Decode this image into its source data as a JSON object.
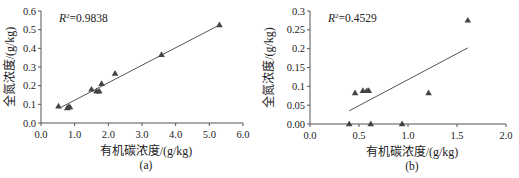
{
  "chart_data": [
    {
      "id": "a",
      "type": "scatter",
      "caption": "(a)",
      "xlabel": "有机碳浓度/(g/kg)",
      "ylabel": "全氮浓度/(g/kg)",
      "annotation": {
        "label": "R",
        "sup": "2",
        "value": "=0.9838"
      },
      "xlim": [
        0.0,
        6.0
      ],
      "ylim": [
        0.0,
        0.6
      ],
      "xticks": [
        "0.0",
        "1.0",
        "2.0",
        "3.0",
        "4.0",
        "5.0",
        "6.0"
      ],
      "yticks": [
        "0.0",
        "0.1",
        "0.2",
        "0.3",
        "0.4",
        "0.5",
        "0.6"
      ],
      "grid": false,
      "marker": "triangle",
      "points": [
        {
          "x": 0.52,
          "y": 0.09
        },
        {
          "x": 0.78,
          "y": 0.08
        },
        {
          "x": 0.82,
          "y": 0.085
        },
        {
          "x": 0.86,
          "y": 0.085
        },
        {
          "x": 1.5,
          "y": 0.18
        },
        {
          "x": 1.65,
          "y": 0.17
        },
        {
          "x": 1.73,
          "y": 0.17
        },
        {
          "x": 1.8,
          "y": 0.21
        },
        {
          "x": 2.2,
          "y": 0.265
        },
        {
          "x": 3.58,
          "y": 0.365
        },
        {
          "x": 5.3,
          "y": 0.525
        }
      ],
      "trendline": {
        "x1": 0.55,
        "y1": 0.08,
        "x2": 5.3,
        "y2": 0.525
      },
      "r_squared": 0.9838
    },
    {
      "id": "b",
      "type": "scatter",
      "caption": "(b)",
      "xlabel": "有机碳浓度/(g/kg)",
      "ylabel": "全氮浓度/(g/kg)",
      "annotation": {
        "label": "R",
        "sup": "2",
        "value": "=0.4529"
      },
      "xlim": [
        0.0,
        2.0
      ],
      "ylim": [
        0.0,
        0.3
      ],
      "xticks": [
        "0.0",
        "0.5",
        "1.0",
        "1.5",
        "2.0"
      ],
      "yticks": [
        "0.00",
        "0.05",
        "0.1",
        "0.15",
        "0.2",
        "0.25",
        "0.3"
      ],
      "grid": false,
      "marker": "triangle",
      "points": [
        {
          "x": 0.4,
          "y": 0.0
        },
        {
          "x": 0.46,
          "y": 0.082
        },
        {
          "x": 0.54,
          "y": 0.088
        },
        {
          "x": 0.58,
          "y": 0.088
        },
        {
          "x": 0.6,
          "y": 0.088
        },
        {
          "x": 0.62,
          "y": 0.0
        },
        {
          "x": 0.94,
          "y": 0.0
        },
        {
          "x": 1.21,
          "y": 0.082
        },
        {
          "x": 1.61,
          "y": 0.275
        }
      ],
      "trendline": {
        "x1": 0.4,
        "y1": 0.035,
        "x2": 1.61,
        "y2": 0.202
      },
      "r_squared": 0.4529
    }
  ],
  "layout": {
    "a": {
      "x0": 41,
      "x1": 243,
      "y0": 123,
      "y1": 11
    },
    "b": {
      "x0": 51,
      "x1": 247,
      "y0": 124,
      "y1": 11
    },
    "colors": {
      "axis": "#555555",
      "marker": "#444444",
      "line": "#555555",
      "text": "#222222"
    }
  }
}
